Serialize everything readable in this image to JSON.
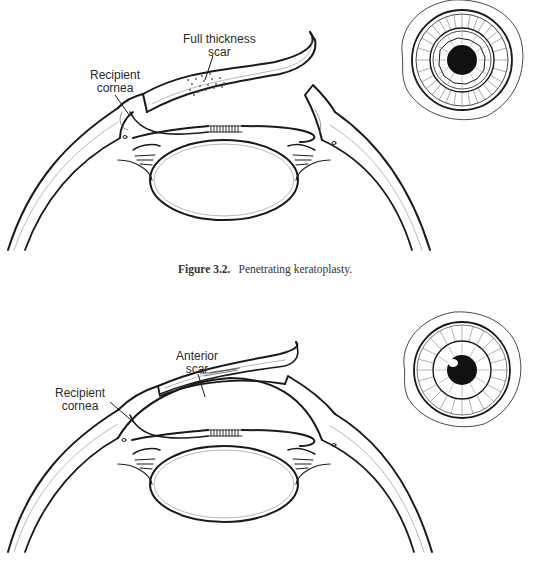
{
  "figures": [
    {
      "id": "top",
      "caption_number": "Figure 3.2.",
      "caption_text": "Penetrating keratoplasty.",
      "labels": {
        "scar": [
          "Full thickness",
          "scar"
        ],
        "recipient": [
          "Recipient",
          "cornea"
        ]
      },
      "scar_type": "full-thickness",
      "inset": "frontal eye view with sutured graft and scar"
    },
    {
      "id": "bottom",
      "caption_number": "",
      "caption_text": "",
      "caption_visible": "clipped at bottom edge",
      "labels": {
        "scar": [
          "Anterior",
          "scar"
        ],
        "recipient": [
          "Recipient",
          "cornea"
        ]
      },
      "scar_type": "anterior",
      "inset": "frontal eye view with radial iris and pupil"
    }
  ],
  "colors": {
    "line": "#1a1a1a",
    "background": "#ffffff",
    "shading": "#9a9a9a"
  }
}
